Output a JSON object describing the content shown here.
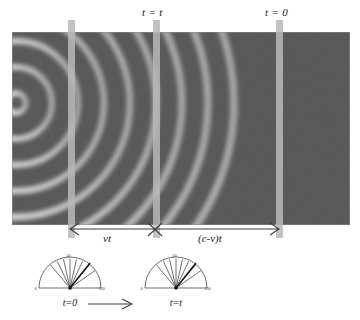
{
  "figure": {
    "type": "physics-diagram",
    "background_color": "#ffffff",
    "panel_color": "#555555",
    "marker_color": "#b9b9b9",
    "ink_color": "#1a1a1a"
  },
  "wave_panel": {
    "name": "wavefront-field",
    "source": {
      "x_px": 16,
      "y_px": 103,
      "label": ""
    },
    "wavelength_px": 26,
    "ring_count": 9,
    "ring_radii_px": [
      10,
      36,
      62,
      88,
      114,
      140,
      166,
      192,
      218
    ],
    "panel_left_px": 12,
    "panel_top_px": 32,
    "panel_width_px": 338,
    "panel_height_px": 193
  },
  "markers": [
    {
      "id": "marker-vt-left",
      "x_px": 68,
      "top_label": "",
      "has_top_label": false
    },
    {
      "id": "marker-t-equals-t",
      "x_px": 153,
      "top_label": "t = t",
      "has_top_label": true
    },
    {
      "id": "marker-t-equals-0",
      "x_px": 276,
      "top_label": "t = 0",
      "has_top_label": true
    }
  ],
  "top_labels": [
    {
      "text": "t = t",
      "x_px": 142
    },
    {
      "text": "t = 0",
      "x_px": 265
    }
  ],
  "dimensions": [
    {
      "id": "dim-vt",
      "label": "vt",
      "from_x_px": 70,
      "to_x_px": 155,
      "label_x_px": 103
    },
    {
      "id": "dim-c-minus-v-t",
      "label": "(c-v)t",
      "from_x_px": 155,
      "to_x_px": 279,
      "label_x_px": 198
    }
  ],
  "gauges": [
    {
      "id": "gauge-t-zero",
      "caption": "t=0",
      "x_px": 34,
      "y_px": 252,
      "min_label": "0",
      "mid_label": "50",
      "max_label": "100",
      "needle_value": 72,
      "tick_count": 9
    },
    {
      "id": "gauge-t-t",
      "caption": "t=t",
      "x_px": 140,
      "y_px": 252,
      "min_label": "0",
      "mid_label": "50",
      "max_label": "100",
      "needle_value": 72,
      "tick_count": 9
    }
  ],
  "flow": {
    "arrow_name": "time-progression-arrow",
    "from_x_px": 88,
    "to_x_px": 132,
    "y_px": 305
  }
}
